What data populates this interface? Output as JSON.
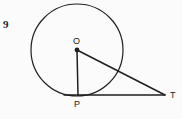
{
  "figure": {
    "problem_number": "9",
    "background_color": "#fbfbfb",
    "stroke_color": "#1f1f1f",
    "label_color": "#1a1a1a",
    "circle": {
      "center_x": 77,
      "center_y": 50,
      "radius": 46
    },
    "points": [
      {
        "id": "O",
        "label": "O",
        "x": 77,
        "y": 50,
        "has_dot": true,
        "role": "center"
      },
      {
        "id": "P",
        "label": "P",
        "x": 78,
        "y": 95,
        "has_dot": false,
        "role": "tangent-point"
      },
      {
        "id": "T",
        "label": "T",
        "x": 165,
        "y": 95,
        "has_dot": false,
        "role": "external-point"
      }
    ],
    "segments": [
      {
        "id": "OP",
        "from": "O",
        "to": "P",
        "label": "radius"
      },
      {
        "id": "OT",
        "from": "O",
        "to": "T",
        "label": "hypotenuse"
      },
      {
        "id": "PT",
        "from": "P",
        "to": "T",
        "label": "tangent"
      }
    ],
    "labels": {
      "center": "O",
      "tangent_point": "P",
      "external_point": "T"
    }
  }
}
